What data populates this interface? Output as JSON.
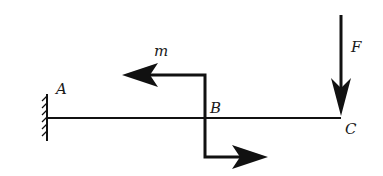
{
  "diagram": {
    "type": "cantilever-beam-loading",
    "labels": {
      "point_a": "A",
      "point_b": "B",
      "point_c": "C",
      "moment": "m",
      "force": "F"
    },
    "colors": {
      "line": "#111111",
      "background": "#ffffff"
    },
    "elements": {
      "support": "fixed wall at A",
      "beam": "horizontal beam from A to C",
      "moment_at_b": "concentrated couple m at B (Z-shaped arrow: left at top, right at bottom)",
      "force_at_c": "downward concentrated force F at C"
    }
  }
}
